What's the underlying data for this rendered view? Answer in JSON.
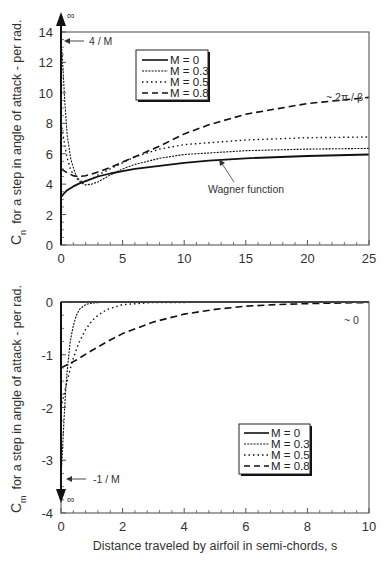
{
  "chart_data": [
    {
      "type": "line",
      "title": "",
      "xlabel": "",
      "ylabel": "C_n for a step in angle of attack - per rad.",
      "ylabel_main": "C",
      "ylabel_sub": "n",
      "ylabel_rest": "for a step in angle of attack - per rad.",
      "xlim": [
        0,
        25
      ],
      "ylim": [
        0,
        14
      ],
      "xticks": [
        "0",
        "5",
        "10",
        "15",
        "20",
        "25"
      ],
      "yticks": [
        "0",
        "2",
        "4",
        "6",
        "8",
        "10",
        "12",
        "14"
      ],
      "grid": false,
      "legend_position": "upper-center-left",
      "legend": [
        "M = 0",
        "M = 0.3",
        "M = 0.5",
        "M = 0.8"
      ],
      "annotations": {
        "infinity": "∞",
        "initial": "4 / M",
        "asymptote": "~ 2π / β",
        "wagner": "Wagner function"
      },
      "series": [
        {
          "name": "M = 0",
          "style": "solid",
          "x": [
            0,
            0.25,
            0.5,
            1,
            1.5,
            2,
            3,
            4,
            5,
            6,
            8,
            10,
            12,
            15,
            20,
            25
          ],
          "y": [
            3.14,
            3.4,
            3.6,
            3.85,
            4.05,
            4.2,
            4.5,
            4.7,
            4.85,
            5.0,
            5.2,
            5.4,
            5.55,
            5.7,
            5.85,
            5.95
          ]
        },
        {
          "name": "M = 0.3",
          "style": "dashed-fine",
          "x": [
            0,
            0.1,
            0.3,
            0.5,
            0.8,
            1.2,
            1.6,
            2,
            2.5,
            3,
            4,
            5,
            6,
            8,
            10,
            15,
            20,
            25
          ],
          "y": [
            13.3,
            12.5,
            9.5,
            7.2,
            5.6,
            4.6,
            4.1,
            3.95,
            4.0,
            4.15,
            4.6,
            5.0,
            5.3,
            5.7,
            5.95,
            6.2,
            6.3,
            6.35
          ]
        },
        {
          "name": "M = 0.5",
          "style": "dotted",
          "x": [
            0,
            0.1,
            0.3,
            0.5,
            0.8,
            1.2,
            1.6,
            2,
            2.5,
            3,
            4,
            5,
            6,
            8,
            10,
            15,
            20,
            25
          ],
          "y": [
            8.0,
            7.6,
            6.6,
            5.7,
            4.9,
            4.4,
            4.2,
            4.2,
            4.35,
            4.6,
            5.0,
            5.4,
            5.8,
            6.3,
            6.6,
            6.9,
            7.05,
            7.1
          ]
        },
        {
          "name": "M = 0.8",
          "style": "dashed-long",
          "x": [
            0,
            0.5,
            1,
            1.5,
            2,
            3,
            4,
            5,
            6,
            8,
            10,
            12,
            15,
            20,
            25
          ],
          "y": [
            5.0,
            4.75,
            4.55,
            4.5,
            4.55,
            4.8,
            5.1,
            5.45,
            5.8,
            6.5,
            7.3,
            7.9,
            8.6,
            9.3,
            9.7
          ]
        }
      ]
    },
    {
      "type": "line",
      "title": "",
      "xlabel": "Distance traveled by airfoil in semi-chords, s",
      "ylabel": "C_m for a step in angle of attack - per rad.",
      "ylabel_main": "C",
      "ylabel_sub": "m",
      "ylabel_rest": "for a step in angle of attack - per rad.",
      "xlim": [
        0,
        10
      ],
      "ylim": [
        -4,
        0
      ],
      "xticks": [
        "0",
        "2",
        "4",
        "6",
        "8",
        "10"
      ],
      "yticks": [
        "-4",
        "-3",
        "-2",
        "-1",
        "0"
      ],
      "grid": false,
      "legend_position": "lower-right",
      "legend": [
        "M = 0",
        "M = 0.3",
        "M = 0.5",
        "M = 0.8"
      ],
      "annotations": {
        "infinity": "∞",
        "initial": "-1 / M",
        "asymptote": "~ 0"
      },
      "series": [
        {
          "name": "M = 0",
          "style": "solid",
          "x": [
            0,
            10
          ],
          "y": [
            0,
            0
          ]
        },
        {
          "name": "M = 0.3",
          "style": "dashed-fine",
          "x": [
            0,
            0.05,
            0.1,
            0.15,
            0.2,
            0.3,
            0.4,
            0.5,
            0.6,
            0.8,
            1.0,
            1.5,
            10
          ],
          "y": [
            -3.33,
            -2.8,
            -2.2,
            -1.7,
            -1.3,
            -0.75,
            -0.45,
            -0.25,
            -0.14,
            -0.05,
            -0.02,
            0,
            0
          ]
        },
        {
          "name": "M = 0.5",
          "style": "dotted",
          "x": [
            0,
            0.1,
            0.2,
            0.3,
            0.4,
            0.5,
            0.6,
            0.8,
            1.0,
            1.2,
            1.5,
            2.0,
            3.0,
            10
          ],
          "y": [
            -2.0,
            -1.75,
            -1.5,
            -1.27,
            -1.07,
            -0.9,
            -0.75,
            -0.52,
            -0.36,
            -0.25,
            -0.14,
            -0.05,
            -0.01,
            0
          ]
        },
        {
          "name": "M = 0.8",
          "style": "dashed-long",
          "x": [
            0,
            0.5,
            1,
            1.5,
            2,
            3,
            4,
            5,
            6,
            7,
            8,
            10
          ],
          "y": [
            -1.25,
            -1.1,
            -0.92,
            -0.75,
            -0.6,
            -0.38,
            -0.23,
            -0.14,
            -0.08,
            -0.05,
            -0.03,
            -0.01
          ]
        }
      ]
    }
  ]
}
